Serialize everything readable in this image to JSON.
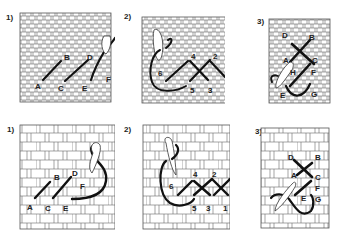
{
  "rows": [
    {
      "name": "fine-fabric",
      "panels": [
        {
          "step": "1)",
          "labels": [
            "A",
            "B",
            "C",
            "D",
            "E",
            "F"
          ],
          "description": "Diagonal half stitches A-B, C-D, E-F with needle"
        },
        {
          "step": "2)",
          "labels": [
            "1",
            "2",
            "3",
            "4",
            "5",
            "6"
          ],
          "description": "Returning to form cross stitches 1-2, 3-4, 5-6"
        },
        {
          "step": "3)",
          "labels": [
            "A",
            "B",
            "C",
            "D",
            "E",
            "F",
            "G",
            "H"
          ],
          "description": "Vertical cross stitch sequence"
        }
      ]
    },
    {
      "name": "coarse-fabric",
      "panels": [
        {
          "step": "1)",
          "labels": [
            "A",
            "B",
            "C",
            "D",
            "E",
            "F"
          ],
          "description": "Diagonal half stitches on coarse weave"
        },
        {
          "step": "2)",
          "labels": [
            "1",
            "2",
            "3",
            "4",
            "5",
            "6"
          ],
          "description": "Completing cross stitches on coarse weave"
        },
        {
          "step": "3)",
          "labels": [
            "A",
            "B",
            "C",
            "D",
            "E",
            "F",
            "G"
          ],
          "description": "Vertical cross stitch sequence on coarse weave"
        }
      ]
    }
  ],
  "colors": {
    "grid": "#555555",
    "thread": "#111111",
    "needle": "#ffffff",
    "background": "#ffffff"
  }
}
